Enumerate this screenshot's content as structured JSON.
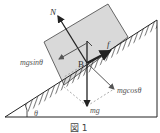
{
  "figure": {
    "caption": "図 1",
    "labels": {
      "normal": "N",
      "friction": "f",
      "point": "B",
      "parallel": "mgsinθ",
      "perpendicular": "mgcosθ",
      "weight": "mg",
      "angle": "θ"
    },
    "colors": {
      "block": "#d9d9d9",
      "line": "#222222",
      "dashed": "#888888"
    }
  }
}
